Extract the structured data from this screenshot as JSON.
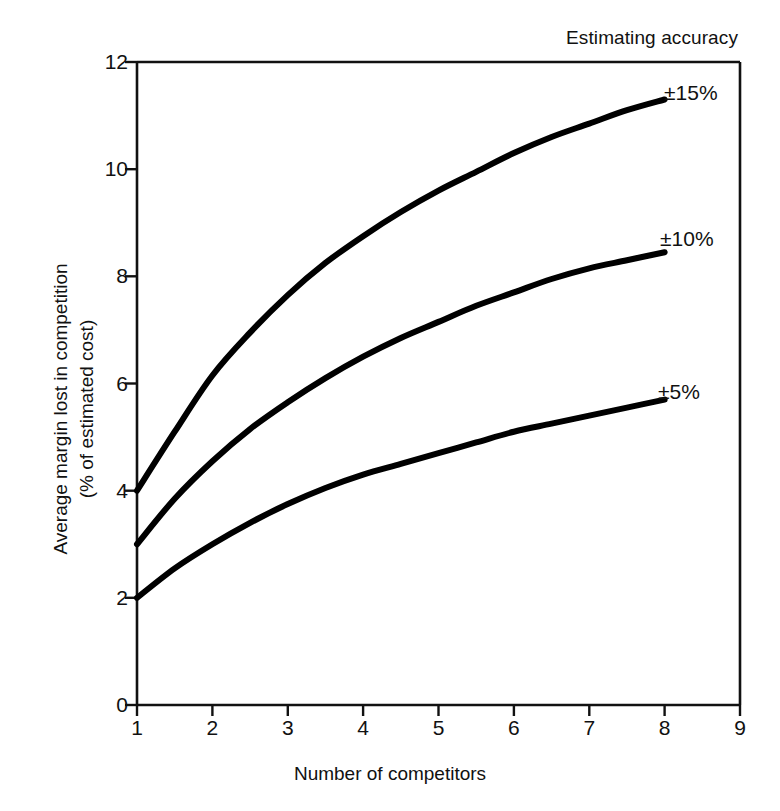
{
  "chart_data": {
    "type": "line",
    "title": "Estimating accuracy",
    "subtitle": "",
    "xlabel": "Number of competitors",
    "ylabel": "Average margin lost in competition (% of estimated cost)",
    "ylabel_line1": "Average margin lost in competition",
    "ylabel_line2": "(% of estimated cost)",
    "xlim": [
      1,
      9
    ],
    "ylim": [
      0,
      12
    ],
    "xticks": [
      1,
      2,
      3,
      4,
      5,
      6,
      7,
      8,
      9
    ],
    "yticks": [
      0,
      2,
      4,
      6,
      8,
      10,
      12
    ],
    "xtick_labels": [
      "1",
      "2",
      "3",
      "4",
      "5",
      "6",
      "7",
      "8",
      "9"
    ],
    "ytick_labels": [
      "0",
      "2",
      "4",
      "6",
      "8",
      "10",
      "12"
    ],
    "grid": false,
    "legend_position": "inline-right-of-curve-ends",
    "x": [
      1,
      1.5,
      2,
      2.5,
      3,
      3.5,
      4,
      4.5,
      5,
      5.5,
      6,
      6.5,
      7,
      7.5,
      8
    ],
    "series": [
      {
        "name": "±15%",
        "label": "±15%",
        "color": "#000000",
        "values": [
          4.0,
          5.1,
          6.15,
          6.95,
          7.65,
          8.25,
          8.75,
          9.2,
          9.6,
          9.95,
          10.3,
          10.6,
          10.85,
          11.1,
          11.3
        ]
      },
      {
        "name": "±10%",
        "label": "±10%",
        "color": "#000000",
        "values": [
          3.0,
          3.85,
          4.55,
          5.15,
          5.65,
          6.1,
          6.5,
          6.85,
          7.15,
          7.45,
          7.7,
          7.95,
          8.15,
          8.3,
          8.45
        ]
      },
      {
        "name": "±5%",
        "label": "±5%",
        "color": "#000000",
        "values": [
          2.0,
          2.55,
          3.0,
          3.4,
          3.75,
          4.05,
          4.3,
          4.5,
          4.7,
          4.9,
          5.1,
          5.25,
          5.4,
          5.55,
          5.7
        ]
      }
    ]
  },
  "figure": {
    "background_color": "#ffffff",
    "axis_color": "#111111",
    "line_color": "#000000"
  }
}
